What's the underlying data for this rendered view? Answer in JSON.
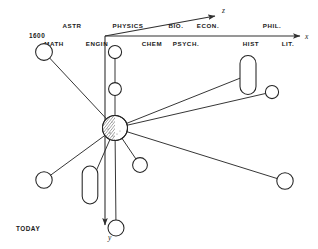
{
  "diagram": {
    "title_hidden": "",
    "axes": {
      "x_label": "x",
      "y_label": "y",
      "z_label": "z",
      "origin_label": "1600",
      "end_label": "TODAY"
    },
    "labels_upper_row": [
      {
        "text": "ASTR",
        "x": 72
      },
      {
        "text": "PHYSICS",
        "x": 128
      },
      {
        "text": "BIO.",
        "x": 176
      },
      {
        "text": "ECON.",
        "x": 208
      },
      {
        "text": "PHIL.",
        "x": 272
      }
    ],
    "labels_lower_row": [
      {
        "text": "MATH",
        "x": 54
      },
      {
        "text": "ENGIN",
        "x": 97
      },
      {
        "text": "CHEM",
        "x": 152
      },
      {
        "text": "PSYCH.",
        "x": 186
      },
      {
        "text": "HIST",
        "x": 251
      },
      {
        "text": "LIT.",
        "x": 288
      }
    ],
    "hub": {
      "name": "central-body",
      "cx": 115,
      "cy": 128,
      "r": 12.5,
      "shading": "hatched-left"
    },
    "nodes": [
      {
        "name": "node-math",
        "shape": "circle",
        "cx": 44,
        "cy": 52,
        "r": 8.4
      },
      {
        "name": "node-engin",
        "shape": "circle",
        "cx": 115,
        "cy": 52,
        "r": 6.6
      },
      {
        "name": "node-chem",
        "shape": "circle",
        "cx": 115,
        "cy": 89,
        "r": 6.4
      },
      {
        "name": "node-hist",
        "shape": "capsule",
        "cx": 248,
        "cy": 75,
        "rx": 8.0,
        "ry": 19.5
      },
      {
        "name": "node-phil",
        "shape": "circle",
        "cx": 272,
        "cy": 92,
        "r": 6.6
      },
      {
        "name": "node-lit",
        "shape": "circle",
        "cx": 285,
        "cy": 181,
        "r": 8.2
      },
      {
        "name": "node-psych",
        "shape": "circle",
        "cx": 140,
        "cy": 165,
        "r": 7.4
      },
      {
        "name": "node-econ",
        "shape": "capsule",
        "cx": 90,
        "cy": 185,
        "rx": 7.8,
        "ry": 19.0
      },
      {
        "name": "node-bio",
        "shape": "circle",
        "cx": 44,
        "cy": 180,
        "r": 8.2
      },
      {
        "name": "node-astr",
        "shape": "circle",
        "cx": 116,
        "cy": 228,
        "r": 8.0
      }
    ],
    "spokes": [
      {
        "name": "spoke-to-math",
        "x2": 44,
        "y2": 52
      },
      {
        "name": "spoke-to-engin",
        "x2": 115,
        "y2": 52
      },
      {
        "name": "spoke-to-hist",
        "x2": 248,
        "y2": 75
      },
      {
        "name": "spoke-to-phil",
        "x2": 272,
        "y2": 92
      },
      {
        "name": "spoke-to-lit",
        "x2": 285,
        "y2": 181
      },
      {
        "name": "spoke-to-psych",
        "x2": 140,
        "y2": 165
      },
      {
        "name": "spoke-to-econ",
        "x2": 90,
        "y2": 185
      },
      {
        "name": "spoke-to-bio",
        "x2": 44,
        "y2": 180
      },
      {
        "name": "spoke-to-astr",
        "x2": 116,
        "y2": 228
      }
    ],
    "colors": {
      "ink": "#242424",
      "background": "#ffffff"
    }
  }
}
